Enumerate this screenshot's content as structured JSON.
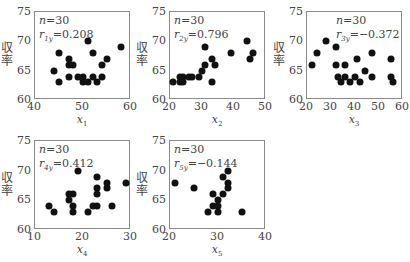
{
  "chart_data": [
    {
      "type": "scatter",
      "title": "",
      "xlabel": "x1",
      "xlabel_base": "x",
      "xlabel_sub": "1",
      "ylabel": "収率",
      "xlim": [
        40,
        60
      ],
      "ylim": [
        60,
        75
      ],
      "xticks": [
        40,
        50,
        60
      ],
      "yticks": [
        60,
        65,
        70,
        75
      ],
      "annotation": {
        "n": "n=30",
        "r_label": "r",
        "r_sub": "1y",
        "r_value": "=0.208"
      },
      "grid": false,
      "points": [
        [
          51,
          70
        ],
        [
          58,
          69
        ],
        [
          45,
          68
        ],
        [
          52,
          68
        ],
        [
          47,
          67
        ],
        [
          55,
          67
        ],
        [
          47,
          66
        ],
        [
          48,
          66
        ],
        [
          54,
          66
        ],
        [
          44,
          65
        ],
        [
          47,
          64
        ],
        [
          49,
          64
        ],
        [
          50,
          64
        ],
        [
          52,
          64
        ],
        [
          54,
          64
        ],
        [
          45,
          63
        ],
        [
          50,
          63
        ],
        [
          51,
          63
        ],
        [
          53,
          63
        ]
      ]
    },
    {
      "type": "scatter",
      "title": "",
      "xlabel": "x2",
      "xlabel_base": "x",
      "xlabel_sub": "2",
      "ylabel": "収率",
      "xlim": [
        20,
        50
      ],
      "ylim": [
        60,
        75
      ],
      "xticks": [
        20,
        30,
        40,
        50
      ],
      "yticks": [
        60,
        65,
        70,
        75
      ],
      "annotation": {
        "n": "n=30",
        "r_label": "r",
        "r_sub": "2y",
        "r_value": "=0.796"
      },
      "grid": false,
      "points": [
        [
          44,
          70
        ],
        [
          31,
          69
        ],
        [
          39,
          68
        ],
        [
          46,
          68
        ],
        [
          33,
          67
        ],
        [
          45,
          67
        ],
        [
          31,
          66
        ],
        [
          34,
          66
        ],
        [
          30,
          65
        ],
        [
          23,
          64
        ],
        [
          24,
          64
        ],
        [
          26,
          64
        ],
        [
          27,
          64
        ],
        [
          29,
          64
        ],
        [
          21,
          63
        ],
        [
          23,
          63
        ],
        [
          24,
          63
        ],
        [
          33,
          63
        ]
      ]
    },
    {
      "type": "scatter",
      "title": "",
      "xlabel": "x3",
      "xlabel_base": "x",
      "xlabel_sub": "3",
      "ylabel": "収率",
      "xlim": [
        20,
        60
      ],
      "ylim": [
        60,
        75
      ],
      "xticks": [
        20,
        30,
        40,
        50,
        60
      ],
      "yticks": [
        60,
        65,
        70,
        75
      ],
      "annotation": {
        "n": "n=30",
        "r_label": "r",
        "r_sub": "3y",
        "r_value": "=−0.372"
      },
      "grid": false,
      "points": [
        [
          28,
          70
        ],
        [
          32,
          69
        ],
        [
          24,
          68
        ],
        [
          47,
          68
        ],
        [
          41,
          67
        ],
        [
          55,
          67
        ],
        [
          22,
          66
        ],
        [
          32,
          66
        ],
        [
          36,
          66
        ],
        [
          44,
          65
        ],
        [
          33,
          64
        ],
        [
          36,
          64
        ],
        [
          40,
          64
        ],
        [
          47,
          64
        ],
        [
          55,
          64
        ],
        [
          34,
          63
        ],
        [
          38,
          63
        ],
        [
          42,
          63
        ],
        [
          56,
          63
        ]
      ]
    },
    {
      "type": "scatter",
      "title": "",
      "xlabel": "x4",
      "xlabel_base": "x",
      "xlabel_sub": "4",
      "ylabel": "収率",
      "xlim": [
        10,
        30
      ],
      "ylim": [
        60,
        75
      ],
      "xticks": [
        10,
        20,
        30
      ],
      "yticks": [
        60,
        65,
        70,
        75
      ],
      "annotation": {
        "n": "n=30",
        "r_label": "r",
        "r_sub": "4y",
        "r_value": "=0.412"
      },
      "grid": false,
      "points": [
        [
          19,
          70
        ],
        [
          23,
          69
        ],
        [
          25,
          68
        ],
        [
          29,
          68
        ],
        [
          23,
          67
        ],
        [
          25,
          67
        ],
        [
          17,
          66
        ],
        [
          18,
          66
        ],
        [
          23,
          66
        ],
        [
          17,
          65
        ],
        [
          13,
          64
        ],
        [
          18,
          64
        ],
        [
          22,
          64
        ],
        [
          23,
          64
        ],
        [
          26,
          64
        ],
        [
          14,
          63
        ],
        [
          18,
          63
        ],
        [
          21,
          63
        ]
      ]
    },
    {
      "type": "scatter",
      "title": "",
      "xlabel": "x5",
      "xlabel_base": "x",
      "xlabel_sub": "5",
      "ylabel": "収率",
      "xlim": [
        20,
        40
      ],
      "ylim": [
        60,
        75
      ],
      "xticks": [
        20,
        30,
        40
      ],
      "yticks": [
        60,
        65,
        70,
        75
      ],
      "annotation": {
        "n": "n=30",
        "r_label": "r",
        "r_sub": "5y",
        "r_value": "=−0.144"
      },
      "grid": false,
      "points": [
        [
          32,
          70
        ],
        [
          31,
          69
        ],
        [
          21,
          68
        ],
        [
          32,
          68
        ],
        [
          25,
          67
        ],
        [
          32,
          67
        ],
        [
          29,
          66
        ],
        [
          31,
          66
        ],
        [
          30,
          65
        ],
        [
          29,
          64
        ],
        [
          30,
          64
        ],
        [
          28,
          63
        ],
        [
          30,
          63
        ],
        [
          35,
          63
        ]
      ]
    }
  ],
  "layout": {
    "panels": [
      {
        "left": 34,
        "top": 11,
        "width": 96,
        "height": 88
      },
      {
        "left": 169,
        "top": 11,
        "width": 96,
        "height": 88
      },
      {
        "left": 306,
        "top": 11,
        "width": 96,
        "height": 88
      },
      {
        "left": 34,
        "top": 140,
        "width": 96,
        "height": 89
      },
      {
        "left": 169,
        "top": 140,
        "width": 96,
        "height": 89
      }
    ],
    "anno_offsets": [
      {
        "dx": 5,
        "dy": 3
      },
      {
        "dx": 5,
        "dy": 3
      },
      {
        "dx": 30,
        "dy": 3
      },
      {
        "dx": 5,
        "dy": 3
      },
      {
        "dx": 5,
        "dy": 3
      }
    ]
  }
}
